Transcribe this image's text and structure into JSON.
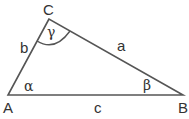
{
  "diagram": {
    "type": "triangle",
    "vertices": {
      "A": "A",
      "B": "B",
      "C": "C"
    },
    "sides": {
      "a": "a",
      "b": "b",
      "c": "c"
    },
    "angles": {
      "alpha": "α",
      "beta": "β",
      "gamma": "γ"
    },
    "colors": {
      "stroke": "#555555",
      "text": "#333333"
    }
  }
}
